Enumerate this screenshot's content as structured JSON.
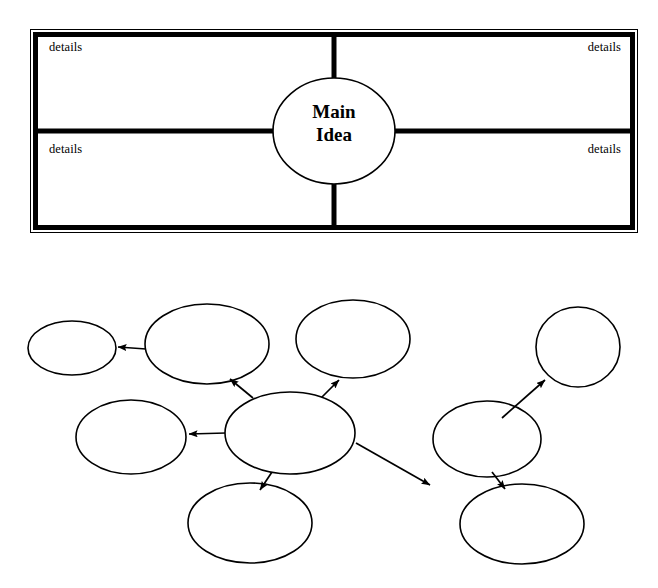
{
  "page": {
    "background_color": "#ffffff",
    "ink_color": "#000000",
    "width": 658,
    "height": 588
  },
  "four_square_organizer": {
    "name": "four-square-main-idea-organizer",
    "center_node": {
      "shape": "ellipse",
      "line_1": "Main",
      "line_2": "Idea"
    },
    "quadrants": [
      {
        "position": "top-left",
        "label": "details",
        "align": "left"
      },
      {
        "position": "top-right",
        "label": "details",
        "align": "right"
      },
      {
        "position": "bottom-left",
        "label": "details",
        "align": "left"
      },
      {
        "position": "bottom-right",
        "label": "details",
        "align": "right"
      }
    ],
    "frame": {
      "outer_stroke_color": "#000000",
      "outer_stroke_width": 1,
      "inner_stroke_color": "#000000",
      "inner_stroke_width": 5,
      "divider_stroke_width": 5
    }
  },
  "concept_map_organizer": {
    "name": "concept-map-main-idea-organizer",
    "center_node": {
      "shape": "ellipse",
      "label": "Main Idea"
    },
    "node_count": 8,
    "arrow_count": 7,
    "stroke_color": "#000000",
    "stroke_width": 1.6,
    "nodes": [
      {
        "id": "n-small-far-left",
        "label": "",
        "cx": 72,
        "cy": 348,
        "rx": 44,
        "ry": 27
      },
      {
        "id": "n-upper-left",
        "label": "",
        "cx": 207,
        "cy": 344,
        "rx": 62,
        "ry": 40
      },
      {
        "id": "n-upper-center",
        "label": "",
        "cx": 353,
        "cy": 339,
        "rx": 57,
        "ry": 39
      },
      {
        "id": "n-upper-right",
        "label": "",
        "cx": 578,
        "cy": 347,
        "rx": 42,
        "ry": 40
      },
      {
        "id": "n-mid-left",
        "label": "",
        "cx": 131,
        "cy": 437,
        "rx": 55,
        "ry": 37
      },
      {
        "id": "n-center",
        "label": "Main Idea",
        "cx": 290,
        "cy": 433,
        "rx": 65,
        "ry": 41
      },
      {
        "id": "n-mid-right",
        "label": "",
        "cx": 487,
        "cy": 439,
        "rx": 54,
        "ry": 38
      },
      {
        "id": "n-bottom-left",
        "label": "",
        "cx": 250,
        "cy": 523,
        "rx": 62,
        "ry": 40
      },
      {
        "id": "n-bottom-right",
        "label": "",
        "cx": 522,
        "cy": 524,
        "rx": 62,
        "ry": 40
      }
    ],
    "arrows": [
      {
        "from": "n-upper-left",
        "to": "n-small-far-left"
      },
      {
        "from": "n-center",
        "to": "n-upper-left"
      },
      {
        "from": "n-center",
        "to": "n-upper-center"
      },
      {
        "from": "n-center",
        "to": "n-mid-left"
      },
      {
        "from": "n-center",
        "to": "n-bottom-left"
      },
      {
        "from": "n-center",
        "to": "n-mid-right"
      },
      {
        "from": "n-mid-right",
        "to": "n-upper-right"
      },
      {
        "from": "n-mid-right",
        "to": "n-bottom-right"
      }
    ]
  }
}
